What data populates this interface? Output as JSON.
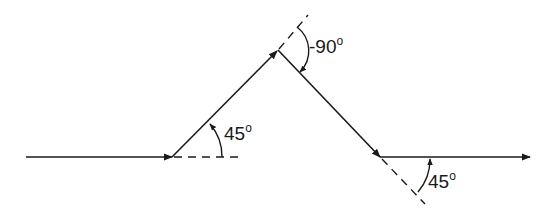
{
  "diagram": {
    "type": "turning-path",
    "stroke_color": "#1a1a1a",
    "background": "#ffffff",
    "segments": [
      {
        "name": "initial-horizontal",
        "from": [
          26,
          157
        ],
        "to": [
          172,
          157
        ],
        "arrow": true
      },
      {
        "name": "rise-45",
        "from": [
          172,
          157
        ],
        "to": [
          278,
          50
        ],
        "arrow": true
      },
      {
        "name": "descend",
        "from": [
          278,
          50
        ],
        "to": [
          380,
          157
        ],
        "arrow": true
      },
      {
        "name": "final-horizontal",
        "from": [
          380,
          157
        ],
        "to": [
          530,
          157
        ],
        "arrow": true
      }
    ],
    "angles": [
      {
        "id": "angle1",
        "value": "45",
        "unit": "°",
        "label": "45°"
      },
      {
        "id": "angle2",
        "value": "-90",
        "unit": "°",
        "label": "-90°"
      },
      {
        "id": "angle3",
        "value": "45",
        "unit": "°",
        "label": "45°"
      }
    ]
  },
  "labels": {
    "angle1_num": "45",
    "angle2_num": "-90",
    "angle3_num": "45",
    "degree_symbol": "o"
  }
}
